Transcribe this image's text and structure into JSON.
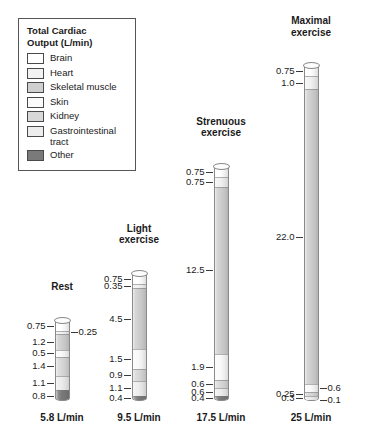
{
  "legend": {
    "title": "Total Cardiac\nOutput (L/min)",
    "items": [
      {
        "label": "Brain",
        "color": "#ffffff"
      },
      {
        "label": "Heart",
        "color": "#f2f2f2"
      },
      {
        "label": "Skeletal muscle",
        "color": "#cfcfcf"
      },
      {
        "label": "Skin",
        "color": "#fafafa"
      },
      {
        "label": "Kidney",
        "color": "#d8d8d8"
      },
      {
        "label": "Gastrointestinal\ntract",
        "color": "#ededed"
      },
      {
        "label": "Other",
        "color": "#7a7a7a"
      }
    ]
  },
  "chart_data": {
    "type": "bar",
    "title": "Total Cardiac Output (L/min)",
    "xlabel": "",
    "ylabel": "Cardiac output (L/min)",
    "stacked": true,
    "orientation": "vertical",
    "grid": false,
    "legend_position": "top-left",
    "ylim": [
      0,
      25
    ],
    "series": [
      {
        "name": "Brain",
        "color": "#ffffff",
        "values": [
          0.75,
          0.75,
          0.75,
          0.75
        ]
      },
      {
        "name": "Heart",
        "color": "#f2f2f2",
        "values": [
          0.25,
          0.35,
          0.75,
          1.0
        ]
      },
      {
        "name": "Skeletal muscle",
        "color": "#cfcfcf",
        "values": [
          1.2,
          4.5,
          12.5,
          22.0
        ]
      },
      {
        "name": "Skin",
        "color": "#fafafa",
        "values": [
          0.5,
          1.5,
          1.9,
          0.6
        ]
      },
      {
        "name": "Kidney",
        "color": "#d8d8d8",
        "values": [
          1.4,
          0.9,
          0.6,
          0.25
        ]
      },
      {
        "name": "Gastrointestinal tract",
        "color": "#ededed",
        "values": [
          1.1,
          1.1,
          0.6,
          0.3
        ]
      },
      {
        "name": "Other",
        "color": "#7a7a7a",
        "values": [
          0.8,
          0.4,
          0.4,
          0.1
        ]
      }
    ],
    "categories": [
      "Rest",
      "Light exercise",
      "Strenuous exercise",
      "Maximal exercise"
    ],
    "totals": [
      5.8,
      9.5,
      17.5,
      25
    ]
  },
  "columns": [
    {
      "key": "rest",
      "title": "Rest",
      "total_label": "5.8 L/min",
      "total": 5.8,
      "segments": [
        {
          "name": "Brain",
          "value": 0.75,
          "label": "0.75",
          "side": "left",
          "color": "#ffffff"
        },
        {
          "name": "Heart",
          "value": 0.25,
          "label": "0.25",
          "side": "right",
          "color": "#f2f2f2"
        },
        {
          "name": "Skeletal muscle",
          "value": 1.2,
          "label": "1.2",
          "side": "left",
          "color": "#cfcfcf"
        },
        {
          "name": "Skin",
          "value": 0.5,
          "label": "0.5",
          "side": "left",
          "color": "#fafafa"
        },
        {
          "name": "Kidney",
          "value": 1.4,
          "label": "1.4",
          "side": "left",
          "color": "#d8d8d8"
        },
        {
          "name": "Gastrointestinal tract",
          "value": 1.1,
          "label": "1.1",
          "side": "left",
          "color": "#ededed"
        },
        {
          "name": "Other",
          "value": 0.8,
          "label": "0.8",
          "side": "left",
          "color": "#7a7a7a"
        }
      ]
    },
    {
      "key": "light-exercise",
      "title": "Light\nexercise",
      "total_label": "9.5 L/min",
      "total": 9.5,
      "segments": [
        {
          "name": "Brain",
          "value": 0.75,
          "label": "0.75",
          "side": "left",
          "color": "#ffffff"
        },
        {
          "name": "Heart",
          "value": 0.35,
          "label": "0.35",
          "side": "left",
          "color": "#f2f2f2"
        },
        {
          "name": "Skeletal muscle",
          "value": 4.5,
          "label": "4.5",
          "side": "left",
          "color": "#cfcfcf"
        },
        {
          "name": "Skin",
          "value": 1.5,
          "label": "1.5",
          "side": "left",
          "color": "#fafafa"
        },
        {
          "name": "Kidney",
          "value": 0.9,
          "label": "0.9",
          "side": "left",
          "color": "#d8d8d8"
        },
        {
          "name": "Gastrointestinal tract",
          "value": 1.1,
          "label": "1.1",
          "side": "left",
          "color": "#ededed"
        },
        {
          "name": "Other",
          "value": 0.4,
          "label": "0.4",
          "side": "left",
          "color": "#7a7a7a"
        }
      ]
    },
    {
      "key": "strenuous-exercise",
      "title": "Strenuous\nexercise",
      "total_label": "17.5 L/min",
      "total": 17.5,
      "segments": [
        {
          "name": "Brain",
          "value": 0.75,
          "label": "0.75",
          "side": "left",
          "color": "#ffffff"
        },
        {
          "name": "Heart",
          "value": 0.75,
          "label": "0.75",
          "side": "left",
          "color": "#f2f2f2"
        },
        {
          "name": "Skeletal muscle",
          "value": 12.5,
          "label": "12.5",
          "side": "left",
          "color": "#cfcfcf"
        },
        {
          "name": "Skin",
          "value": 1.9,
          "label": "1.9",
          "side": "left",
          "color": "#fafafa"
        },
        {
          "name": "Kidney",
          "value": 0.6,
          "label": "0.6",
          "side": "left",
          "color": "#d8d8d8"
        },
        {
          "name": "Gastrointestinal tract",
          "value": 0.6,
          "label": "0.6",
          "side": "left",
          "color": "#ededed"
        },
        {
          "name": "Other",
          "value": 0.4,
          "label": "0.4",
          "side": "left",
          "color": "#7a7a7a"
        }
      ]
    },
    {
      "key": "maximal-exercise",
      "title": "Maximal\nexercise",
      "total_label": "25 L/min",
      "total": 25,
      "segments": [
        {
          "name": "Brain",
          "value": 0.75,
          "label": "0.75",
          "side": "left",
          "color": "#ffffff"
        },
        {
          "name": "Heart",
          "value": 1.0,
          "label": "1.0",
          "side": "left",
          "color": "#f2f2f2"
        },
        {
          "name": "Skeletal muscle",
          "value": 22.0,
          "label": "22.0",
          "side": "left",
          "color": "#cfcfcf"
        },
        {
          "name": "Skin",
          "value": 0.6,
          "label": "0.6",
          "side": "right",
          "color": "#fafafa"
        },
        {
          "name": "Kidney",
          "value": 0.25,
          "label": "0.25",
          "side": "left",
          "color": "#d8d8d8"
        },
        {
          "name": "Gastrointestinal tract",
          "value": 0.3,
          "label": "0.3",
          "side": "left",
          "color": "#ededed"
        },
        {
          "name": "Other",
          "value": 0.1,
          "label": "0.1",
          "side": "right",
          "color": "#7a7a7a"
        }
      ]
    }
  ],
  "layout": {
    "px_per_unit": 13.4,
    "bar_width": 15,
    "columns_x": [
      62,
      139,
      221,
      311
    ],
    "title_offsets": [
      28,
      28,
      28,
      28
    ]
  }
}
